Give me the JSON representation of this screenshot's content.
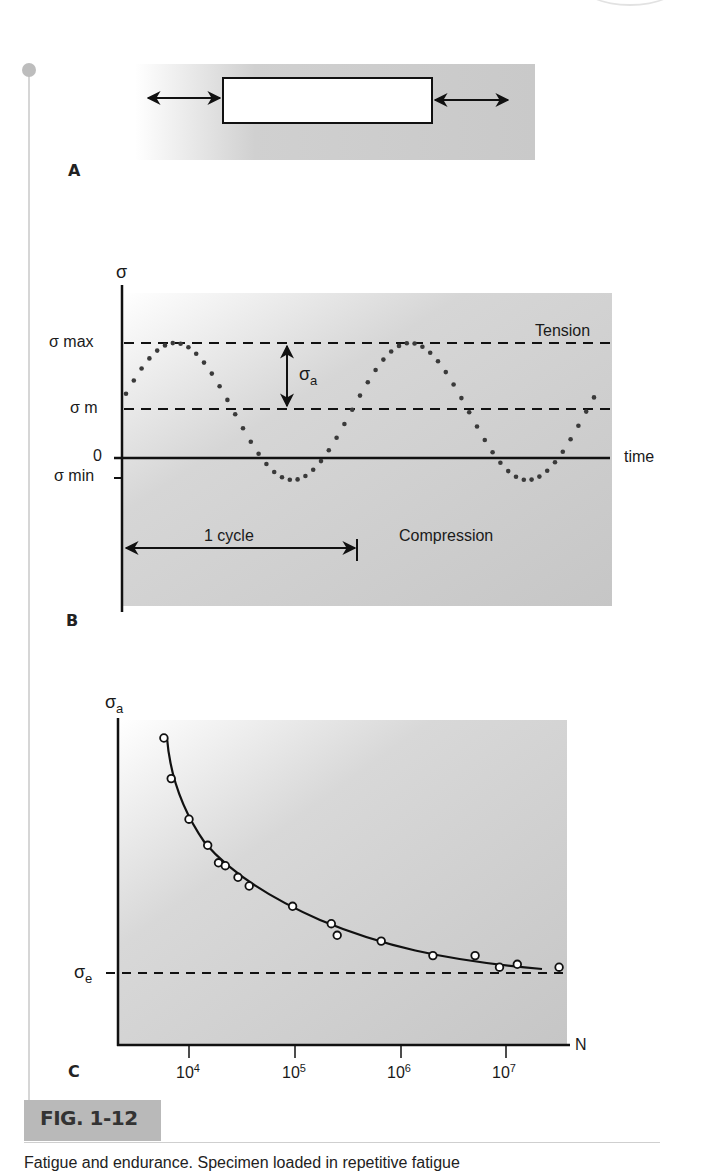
{
  "figure": {
    "label": "FIG. 1-12",
    "caption_partial": "Fatigue and endurance. Specimen loaded in repetitive fatigue",
    "colors": {
      "panel_bg": "#c8c8c8",
      "fig_box": "#b9b9b9",
      "ink": "#1a1a1a",
      "dots": "#3a3a3a"
    }
  },
  "panel_a": {
    "label": "A"
  },
  "panel_b": {
    "label": "B",
    "y_axis_label": "σ",
    "levels": {
      "sigma_max": "σ max",
      "sigma_m": "σ m",
      "zero": "0",
      "sigma_min": "σ min"
    },
    "amplitude_label": "σ",
    "amplitude_sub": "a",
    "tension_label": "Tension",
    "compression_label": "Compression",
    "time_label": "time",
    "cycle_label": "1 cycle"
  },
  "panel_c": {
    "label": "C",
    "y_axis_label": "σ",
    "y_axis_sub": "a",
    "endurance_label": "σ",
    "endurance_sub": "e",
    "x_axis_label": "N",
    "ticks": [
      {
        "base": "10",
        "exp": "4"
      },
      {
        "base": "10",
        "exp": "5"
      },
      {
        "base": "10",
        "exp": "6"
      },
      {
        "base": "10",
        "exp": "7"
      }
    ]
  },
  "chart_data": [
    {
      "type": "line",
      "title": "B: Cyclic stress vs time",
      "xlabel": "time",
      "ylabel": "σ",
      "series": [
        {
          "name": "stress (sinusoidal, dotted)",
          "description": "sine oscillating between σmax and σmin about mean σm"
        }
      ],
      "annotations": [
        "σ max",
        "σ m",
        "0",
        "σ min",
        "σa (amplitude σmax−σm)",
        "Tension (above 0)",
        "Compression (below 0)",
        "1 cycle"
      ],
      "relative_levels": {
        "sigma_max": 1.0,
        "sigma_m": 0.57,
        "zero": 0.0,
        "sigma_min": -0.14
      },
      "cycles_shown": 2
    },
    {
      "type": "scatter",
      "title": "C: S–N (Wöhler) curve",
      "xlabel": "N",
      "ylabel": "σa",
      "x_scale": "log",
      "x_ticks": [
        "10^4",
        "10^5",
        "10^6",
        "10^7"
      ],
      "x": [
        5800.0,
        6800.0,
        10000.0,
        15000.0,
        19000.0,
        22000.0,
        29000.0,
        37000.0,
        95000.0,
        220000.0,
        250000.0,
        650000.0,
        2000000.0,
        5000000.0,
        8500000.0,
        12500000.0,
        31000000.0
      ],
      "y_relative": [
        1.0,
        0.86,
        0.72,
        0.63,
        0.57,
        0.56,
        0.52,
        0.49,
        0.42,
        0.36,
        0.32,
        0.3,
        0.25,
        0.25,
        0.21,
        0.22,
        0.21
      ],
      "fit": "decaying curve asymptotic to σe",
      "asymptote": {
        "label": "σe",
        "y_relative": 0.19
      }
    }
  ]
}
